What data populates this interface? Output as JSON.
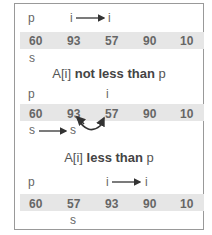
{
  "diagram": {
    "panels": [
      {
        "pointers": {
          "p": "p",
          "i_from": "i",
          "i_to": "i"
        },
        "array": [
          "60",
          "93",
          "57",
          "90",
          "10"
        ],
        "s_label": "s"
      },
      {
        "caption_prefix": "A[i] ",
        "caption_bold": "not less than",
        "caption_suffix": " p",
        "pointers": {
          "p": "p",
          "i": "i"
        },
        "array": [
          "60",
          "93",
          "57",
          "90",
          "10"
        ],
        "s_from": "s",
        "s_to": "s",
        "swap": "swap 93 and 57"
      },
      {
        "caption_prefix": "A[i] ",
        "caption_bold": "less than",
        "caption_suffix": " p",
        "pointers": {
          "p": "p",
          "i_from": "i",
          "i_to": "i"
        },
        "array": [
          "60",
          "57",
          "93",
          "90",
          "10"
        ],
        "s_label": "s"
      }
    ],
    "colors": {
      "band": "#e6e6e6",
      "text": "#666666",
      "border": "#999999"
    }
  }
}
